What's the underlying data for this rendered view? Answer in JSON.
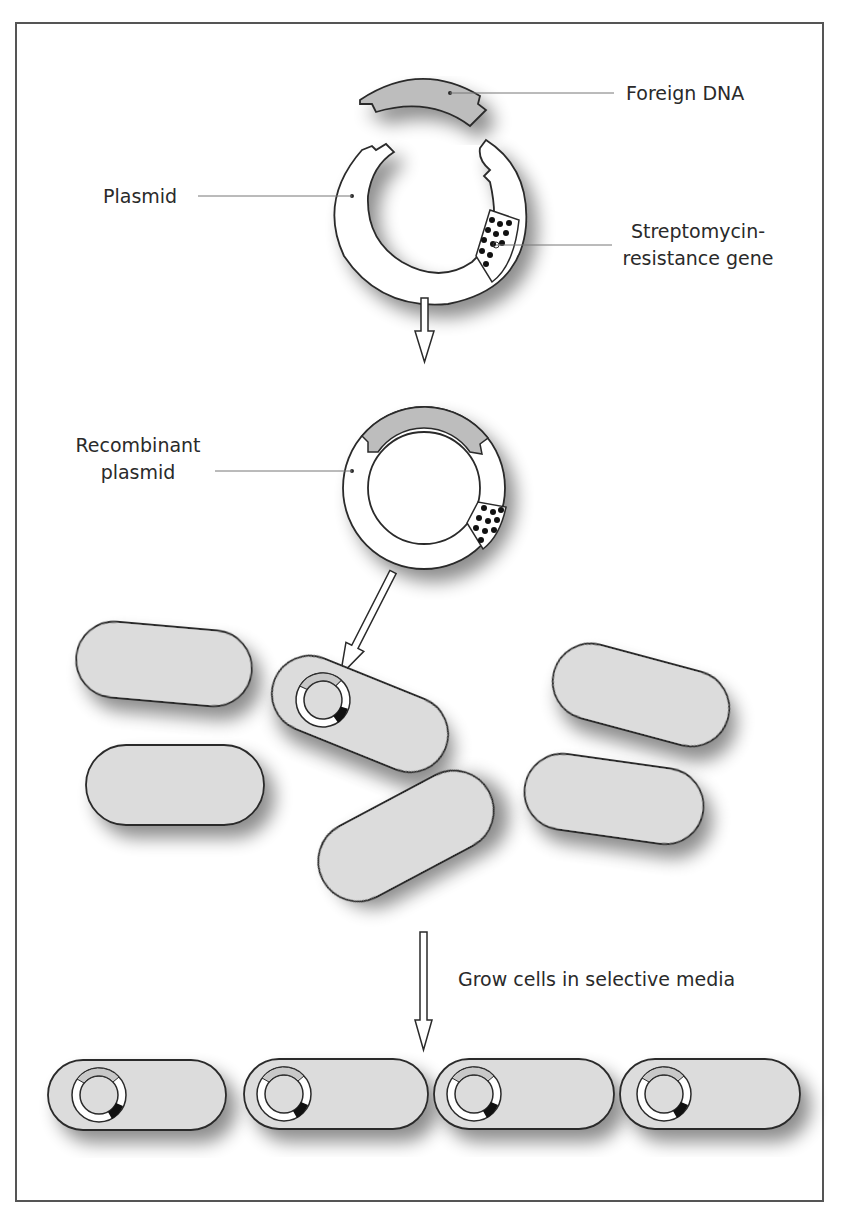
{
  "figure": {
    "colors": {
      "frame": "#555555",
      "outline": "#2a2a2a",
      "cell_fill": "#dcdcdc",
      "dna_fill": "#bdbdbd",
      "plasmid_fill": "#ffffff",
      "gene_dot": "#111111",
      "leader_line": "#777777",
      "text": "#2a2a2a"
    }
  },
  "labels": {
    "foreign_dna": "Foreign DNA",
    "plasmid": "Plasmid",
    "streptomycin_line1": "Streptomycin-",
    "streptomycin_line2": "resistance gene",
    "recombinant_line1": "Recombinant",
    "recombinant_line2": "plasmid",
    "grow_cells": "Grow cells in selective media"
  },
  "stages": [
    {
      "name": "cut plasmid and foreign DNA fragment"
    },
    {
      "name": "recombinant plasmid"
    },
    {
      "name": "bacterial population, one cell takes up plasmid",
      "cell_count": 6,
      "transformed_count": 1
    },
    {
      "name": "selected transformed cells",
      "cell_count": 4,
      "transformed_count": 4
    }
  ]
}
